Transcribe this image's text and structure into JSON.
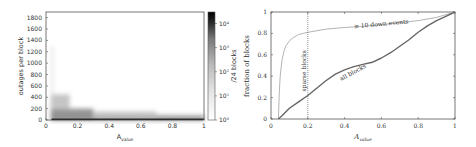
{
  "chart_data": [
    {
      "type": "heatmap",
      "title": "",
      "xlabel": "A_value",
      "ylabel": "outages per block",
      "xlim": [
        0,
        1
      ],
      "ylim": [
        0,
        1900
      ],
      "xticks": [
        "0",
        "0.2",
        "0.4",
        "0.6",
        "0.8",
        "1"
      ],
      "xtick_values": [
        0,
        0.2,
        0.4,
        0.6,
        0.8,
        1
      ],
      "yticks": [
        "0",
        "200",
        "400",
        "600",
        "800",
        "1000",
        "1200",
        "1400",
        "1600",
        "1800"
      ],
      "ytick_values": [
        0,
        200,
        400,
        600,
        800,
        1000,
        1200,
        1400,
        1600,
        1800
      ],
      "colorbar": {
        "label": "/24 blocks",
        "scale": "log",
        "ticks": [
          "10^0",
          "10^1",
          "10^2",
          "10^3",
          "10^4"
        ],
        "tick_values": [
          1,
          10,
          100,
          1000,
          10000
        ],
        "range": [
          1,
          30000
        ]
      },
      "density_regions": [
        {
          "x_range": [
            0.03,
            1.0
          ],
          "y_range": [
            0,
            40
          ],
          "density": 4.0
        },
        {
          "x_range": [
            0.03,
            0.3
          ],
          "y_range": [
            40,
            200
          ],
          "density": 2.2
        },
        {
          "x_range": [
            0.03,
            0.15
          ],
          "y_range": [
            200,
            450
          ],
          "density": 1.2
        },
        {
          "x_range": [
            0.3,
            0.7
          ],
          "y_range": [
            40,
            150
          ],
          "density": 1.2
        },
        {
          "x_range": [
            0.7,
            1.0
          ],
          "y_range": [
            40,
            90
          ],
          "density": 1.6
        },
        {
          "x_range": [
            0.035,
            0.045
          ],
          "y_range": [
            450,
            1300
          ],
          "density": 0.8
        }
      ],
      "grid": false
    },
    {
      "type": "line",
      "title": "",
      "xlabel": "A_value",
      "ylabel": "fraction of blocks",
      "xlim": [
        0,
        1
      ],
      "ylim": [
        0,
        1
      ],
      "xticks": [
        "0",
        "0.2",
        "0.4",
        "0.6",
        "0.8",
        "1"
      ],
      "xtick_values": [
        0,
        0.2,
        0.4,
        0.6,
        0.8,
        1
      ],
      "yticks": [
        "0",
        "0.2",
        "0.4",
        "0.6",
        "0.8",
        "1"
      ],
      "ytick_values": [
        0,
        0.2,
        0.4,
        0.6,
        0.8,
        1
      ],
      "series": [
        {
          "name": "≥ 10 down events",
          "color": "#aaaaaa",
          "x": [
            0.04,
            0.045,
            0.05,
            0.06,
            0.07,
            0.08,
            0.1,
            0.12,
            0.15,
            0.2,
            0.3,
            0.4,
            0.5,
            0.6,
            0.7,
            0.8,
            0.9,
            1.0
          ],
          "y": [
            0.0,
            0.25,
            0.4,
            0.55,
            0.63,
            0.68,
            0.73,
            0.76,
            0.79,
            0.81,
            0.84,
            0.855,
            0.865,
            0.88,
            0.9,
            0.92,
            0.95,
            1.0
          ]
        },
        {
          "name": "all blocks",
          "color": "#666666",
          "x": [
            0.04,
            0.06,
            0.1,
            0.15,
            0.2,
            0.25,
            0.3,
            0.35,
            0.4,
            0.45,
            0.5,
            0.55,
            0.6,
            0.65,
            0.7,
            0.75,
            0.8,
            0.85,
            0.9,
            0.95,
            1.0
          ],
          "y": [
            0.0,
            0.03,
            0.1,
            0.16,
            0.22,
            0.29,
            0.36,
            0.42,
            0.46,
            0.49,
            0.51,
            0.53,
            0.57,
            0.62,
            0.68,
            0.74,
            0.81,
            0.87,
            0.92,
            0.96,
            1.0
          ]
        }
      ],
      "annotations": [
        {
          "text": "sparse blocks",
          "type": "vline",
          "x": 0.2
        },
        {
          "text": "≥ 10 down events",
          "x": 0.6,
          "y": 0.87
        },
        {
          "text": "all blocks",
          "x": 0.45,
          "y": 0.42
        }
      ],
      "legend": "none",
      "grid": false
    }
  ]
}
